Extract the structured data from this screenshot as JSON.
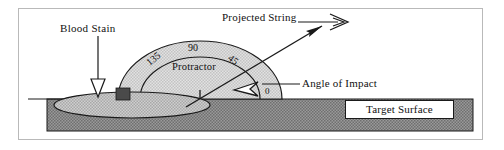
{
  "figure": {
    "kind": "bloodstain-angle-of-impact-diagram",
    "labels": {
      "blood_stain": "Blood  Stain",
      "projected_string": "Projected String",
      "angle_of_impact": "Angle of Impact",
      "protractor": "Protractor",
      "target_surface": "Target Surface"
    },
    "protractor_ticks": {
      "deg_0": "0",
      "deg_45": "45",
      "deg_90": "90",
      "deg_135": "135"
    },
    "icons": {
      "blood_stain_pointer": "down-arrow-icon",
      "projected_string_pointer": "right-arrow-icon",
      "angle_pointer": "left-arrow-icon"
    }
  },
  "colors": {
    "frame_border": "#b9b9b9",
    "ink": "#1a1a1a",
    "protractor_fill": "#d0d0d0",
    "stain_fill": "#bdbdbd",
    "surface_fill": "#8f8f8f",
    "box_fill": "#ffffff"
  }
}
